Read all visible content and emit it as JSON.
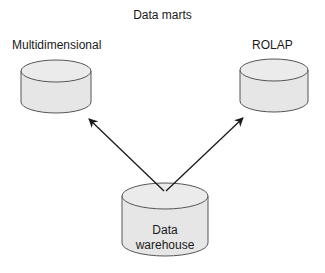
{
  "title": "Data marts",
  "nodes": {
    "multidimensional": {
      "label": "Multidimensional"
    },
    "rolap": {
      "label": "ROLAP"
    },
    "warehouse": {
      "line1": "Data",
      "line2": "warehouse"
    }
  },
  "edges": [
    {
      "from": "warehouse",
      "to": "multidimensional"
    },
    {
      "from": "warehouse",
      "to": "rolap"
    }
  ],
  "colors": {
    "fill": "#e6e6e6",
    "stroke": "#555555",
    "arrow": "#1a1a1a"
  }
}
